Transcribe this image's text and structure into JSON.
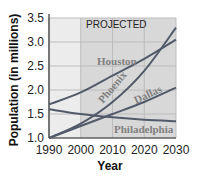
{
  "chart_data": {
    "type": "line",
    "title": "",
    "annotation": "PROJECTED",
    "xlabel": "Year",
    "ylabel": "Population (in millions)",
    "xlim": [
      1990,
      2030
    ],
    "ylim": [
      1.0,
      3.5
    ],
    "x_ticks": [
      "1990",
      "2000",
      "2010",
      "2020",
      "2030"
    ],
    "y_ticks": [
      "1.0",
      "1.5",
      "2.0",
      "2.5",
      "3.0",
      "3.5"
    ],
    "grid": true,
    "projected_region": [
      2000,
      2030
    ],
    "x": [
      1990,
      2000,
      2010,
      2020,
      2030
    ],
    "series": [
      {
        "name": "Houston",
        "values": [
          1.7,
          1.95,
          2.3,
          2.65,
          3.05
        ]
      },
      {
        "name": "Phoenix",
        "values": [
          1.0,
          1.3,
          1.75,
          2.4,
          3.3
        ]
      },
      {
        "name": "Dallas",
        "values": [
          1.0,
          1.25,
          1.5,
          1.75,
          2.05
        ]
      },
      {
        "name": "Philadelphia",
        "values": [
          1.6,
          1.5,
          1.43,
          1.38,
          1.35
        ]
      }
    ],
    "colors": {
      "line": "#525a6a",
      "historical_bg": "#ececec",
      "projected_bg": "#d8d8d8",
      "grid": "#bcbcbc",
      "series_label": "#808080"
    }
  }
}
